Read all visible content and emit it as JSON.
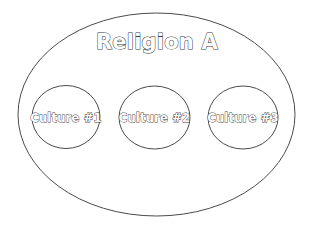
{
  "diagram": {
    "type": "venn-nested-set",
    "background_color": "#ffffff",
    "stroke_color": "#4a4a4a",
    "text_fill_color": "#ffffff",
    "text_outline_color": "#3a3a3a",
    "outer_set": {
      "label": "Religion A",
      "shape": "ellipse",
      "cx": 156.5,
      "cy": 114.5,
      "rx": 138.5,
      "ry": 101.5,
      "label_x": 157,
      "label_y": 43
    },
    "inner_sets": [
      {
        "label": "Culture #1",
        "shape": "ellipse",
        "cx": 66,
        "cy": 117,
        "rx": 34,
        "ry": 31.5
      },
      {
        "label": "Culture #2",
        "shape": "ellipse",
        "cx": 154.5,
        "cy": 117.5,
        "rx": 35.5,
        "ry": 31.5
      },
      {
        "label": "Culture #3",
        "shape": "ellipse",
        "cx": 243,
        "cy": 117.5,
        "rx": 35,
        "ry": 31.5
      }
    ]
  }
}
